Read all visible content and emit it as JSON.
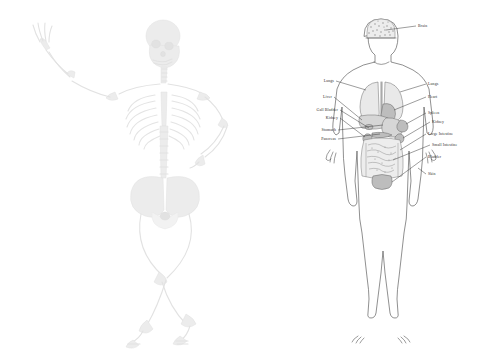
{
  "figure": {
    "background_color": "#ffffff",
    "panels": [
      {
        "name": "skeleton",
        "title": "Human Skeleton",
        "style": "pale grayscale skeletal rendering, left arm raised, right hand on hip, legs crossed"
      },
      {
        "name": "anatomy",
        "title": "Human Internal Organs",
        "style": "line-art body outline with labeled internal organs"
      }
    ]
  },
  "anatomy": {
    "labels_left": [
      {
        "id": "lungs-left",
        "text": "Lungs"
      },
      {
        "id": "liver",
        "text": "Liver"
      },
      {
        "id": "gall-bladder",
        "text": "Gall Bladder"
      },
      {
        "id": "kidney-left",
        "text": "Kidney"
      },
      {
        "id": "stomach",
        "text": "Stomach"
      },
      {
        "id": "pancreas",
        "text": "Pancreas"
      }
    ],
    "labels_right": [
      {
        "id": "lungs-right",
        "text": "Lungs"
      },
      {
        "id": "heart",
        "text": "Heart"
      },
      {
        "id": "spleen",
        "text": "Spleen"
      },
      {
        "id": "kidney-right",
        "text": "Kidney"
      },
      {
        "id": "large-intestine",
        "text": "Large Intestine"
      },
      {
        "id": "small-intestine",
        "text": "Small Intestine"
      },
      {
        "id": "bladder",
        "text": "Bladder"
      },
      {
        "id": "skin",
        "text": "Skin"
      }
    ],
    "labels_top": [
      {
        "id": "brain",
        "text": "Brain"
      }
    ],
    "colors": {
      "outline": "#4a4a4a",
      "leader": "#3c3c3c",
      "label_text": "#2e2e2e",
      "organ_light": "#e9e9e9",
      "organ_mid": "#d6d6d6",
      "organ_dark": "#bdbdbd"
    }
  },
  "skeleton": {
    "colors": {
      "bone": "#ececec",
      "bone_light": "#f2f2f2",
      "bone_dark": "#e2e2e2"
    }
  }
}
